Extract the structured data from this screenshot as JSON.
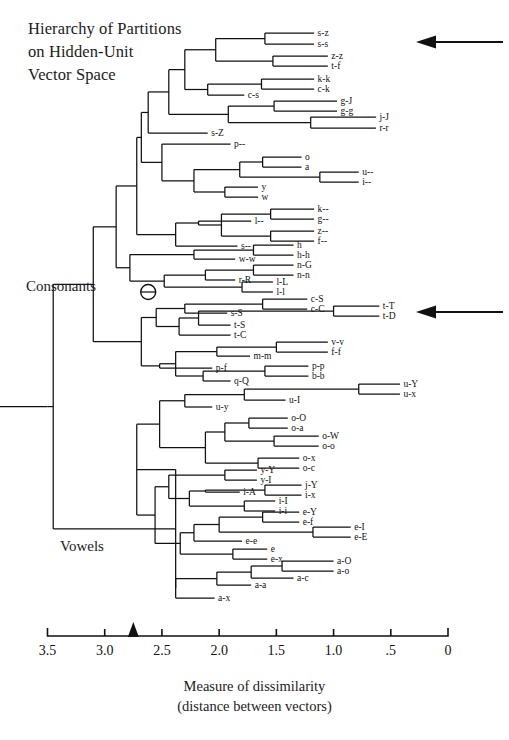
{
  "title": "Hierarchy of Partitions\non Hidden-Unit\nVector Space",
  "group_labels": {
    "consonants": "Consonants",
    "vowels": "Vowels"
  },
  "axis": {
    "caption": "Measure of dissimilarity\n(distance between vectors)",
    "ticks": [
      "3.5",
      "3.0",
      "2.5",
      "2.0",
      "1.5",
      "1.0",
      ".5",
      "0"
    ],
    "tick_values": [
      3.5,
      3.0,
      2.5,
      2.0,
      1.5,
      1.0,
      0.5,
      0
    ],
    "range": [
      3.5,
      0
    ],
    "marker_value": 2.75,
    "marker_name": "cut-level-marker"
  },
  "annotations": [
    {
      "name": "arrow-top",
      "target": "s-z / s-s cluster",
      "value_y": 42
    },
    {
      "name": "arrow-middle",
      "target": "t-T / t-D cluster",
      "value_y": 312
    }
  ],
  "node_marker": {
    "name": "circled-split-node",
    "x": 2.62,
    "y": 292
  },
  "chart_data": {
    "type": "dendrogram",
    "title": "Hierarchy of Partitions on Hidden-Unit Vector Space",
    "xlabel": "Measure of dissimilarity (distance between vectors)",
    "ylabel": "",
    "xlim": [
      3.5,
      0
    ],
    "grid": false,
    "orientation": "horizontal-right-to-left",
    "leaves": [
      {
        "label": "s-z",
        "y": 33,
        "x": 1.17
      },
      {
        "label": "s-s",
        "y": 44,
        "x": 1.17
      },
      {
        "label": "z-z",
        "y": 56,
        "x": 1.05
      },
      {
        "label": "t-f",
        "y": 66,
        "x": 1.05
      },
      {
        "label": "k-k",
        "y": 79,
        "x": 1.17
      },
      {
        "label": "c-k",
        "y": 89,
        "x": 1.17
      },
      {
        "label": "g-J",
        "y": 101,
        "x": 0.97
      },
      {
        "label": "g-g",
        "y": 111,
        "x": 0.97
      },
      {
        "label": "j-J",
        "y": 117,
        "x": 0.63
      },
      {
        "label": "r-r",
        "y": 128,
        "x": 0.63
      },
      {
        "label": "c-s",
        "y": 95,
        "x": 1.78
      },
      {
        "label": "s-Z",
        "y": 133,
        "x": 2.1
      },
      {
        "label": "p--",
        "y": 144,
        "x": 1.9
      },
      {
        "label": "o",
        "y": 157,
        "x": 1.28
      },
      {
        "label": "a",
        "y": 167,
        "x": 1.28
      },
      {
        "label": "u--",
        "y": 172,
        "x": 0.78
      },
      {
        "label": "i--",
        "y": 182,
        "x": 0.78
      },
      {
        "label": "y",
        "y": 187,
        "x": 1.66
      },
      {
        "label": "w",
        "y": 197,
        "x": 1.66
      },
      {
        "label": "k--",
        "y": 209,
        "x": 1.17
      },
      {
        "label": "g--",
        "y": 219,
        "x": 1.17
      },
      {
        "label": "z--",
        "y": 231,
        "x": 1.17
      },
      {
        "label": "f--",
        "y": 241,
        "x": 1.17
      },
      {
        "label": "l--",
        "y": 221,
        "x": 1.72
      },
      {
        "label": "s--",
        "y": 246,
        "x": 1.84
      },
      {
        "label": "h",
        "y": 245,
        "x": 1.35
      },
      {
        "label": "h-h",
        "y": 255,
        "x": 1.35
      },
      {
        "label": "w-w",
        "y": 259,
        "x": 1.86
      },
      {
        "label": "n-G",
        "y": 265,
        "x": 1.35
      },
      {
        "label": "n-n",
        "y": 275,
        "x": 1.35
      },
      {
        "label": "r-R",
        "y": 280,
        "x": 1.86
      },
      {
        "label": "l-L",
        "y": 282,
        "x": 1.53
      },
      {
        "label": "l-l",
        "y": 292,
        "x": 1.53
      },
      {
        "label": "c-S",
        "y": 299,
        "x": 1.23
      },
      {
        "label": "c-C",
        "y": 309,
        "x": 1.23
      },
      {
        "label": "s-S",
        "y": 313,
        "x": 1.93
      },
      {
        "label": "t-T",
        "y": 306,
        "x": 0.6
      },
      {
        "label": "t-D",
        "y": 316,
        "x": 0.6
      },
      {
        "label": "t-S",
        "y": 325,
        "x": 1.9
      },
      {
        "label": "t-C",
        "y": 335,
        "x": 1.9
      },
      {
        "label": "v-v",
        "y": 342,
        "x": 1.05
      },
      {
        "label": "f-f",
        "y": 352,
        "x": 1.05
      },
      {
        "label": "m-m",
        "y": 356,
        "x": 1.73
      },
      {
        "label": "p-f",
        "y": 368,
        "x": 2.06
      },
      {
        "label": "p-p",
        "y": 366,
        "x": 1.22
      },
      {
        "label": "b-b",
        "y": 376,
        "x": 1.22
      },
      {
        "label": "q-Q",
        "y": 381,
        "x": 1.9
      },
      {
        "label": "u-Y",
        "y": 384,
        "x": 0.42
      },
      {
        "label": "u-x",
        "y": 394,
        "x": 0.42
      },
      {
        "label": "u-I",
        "y": 400,
        "x": 1.42
      },
      {
        "label": "u-y",
        "y": 407,
        "x": 2.06
      },
      {
        "label": "o-O",
        "y": 418,
        "x": 1.4
      },
      {
        "label": "o-a",
        "y": 428,
        "x": 1.4
      },
      {
        "label": "o-W",
        "y": 436,
        "x": 1.13
      },
      {
        "label": "o-o",
        "y": 446,
        "x": 1.13
      },
      {
        "label": "o-x",
        "y": 458,
        "x": 1.3
      },
      {
        "label": "o-c",
        "y": 468,
        "x": 1.3
      },
      {
        "label": "y-Y",
        "y": 470,
        "x": 1.67
      },
      {
        "label": "y-I",
        "y": 480,
        "x": 1.67
      },
      {
        "label": "j-Y",
        "y": 485,
        "x": 1.28
      },
      {
        "label": "i-x",
        "y": 495,
        "x": 1.28
      },
      {
        "label": "i-A",
        "y": 492,
        "x": 1.82
      },
      {
        "label": "i-I",
        "y": 501,
        "x": 1.51
      },
      {
        "label": "i-i",
        "y": 511,
        "x": 1.51
      },
      {
        "label": "e-Y",
        "y": 512,
        "x": 1.3
      },
      {
        "label": "e-f",
        "y": 522,
        "x": 1.3
      },
      {
        "label": "e-I",
        "y": 527,
        "x": 0.85
      },
      {
        "label": "e-E",
        "y": 537,
        "x": 0.85
      },
      {
        "label": "e-e",
        "y": 541,
        "x": 1.8
      },
      {
        "label": "e",
        "y": 549,
        "x": 1.58
      },
      {
        "label": "e-x",
        "y": 559,
        "x": 1.58
      },
      {
        "label": "a-O",
        "y": 561,
        "x": 1.0
      },
      {
        "label": "a-o",
        "y": 571,
        "x": 1.0
      },
      {
        "label": "a-c",
        "y": 578,
        "x": 1.35
      },
      {
        "label": "a-a",
        "y": 585,
        "x": 1.72
      },
      {
        "label": "a-x",
        "y": 598,
        "x": 2.04
      }
    ],
    "major_splits": [
      {
        "name": "root",
        "x": 3.45,
        "children": [
          "consonants",
          "vowels"
        ]
      },
      {
        "name": "consonants",
        "x": 2.62
      },
      {
        "name": "vowels",
        "x": 2.38
      }
    ]
  }
}
